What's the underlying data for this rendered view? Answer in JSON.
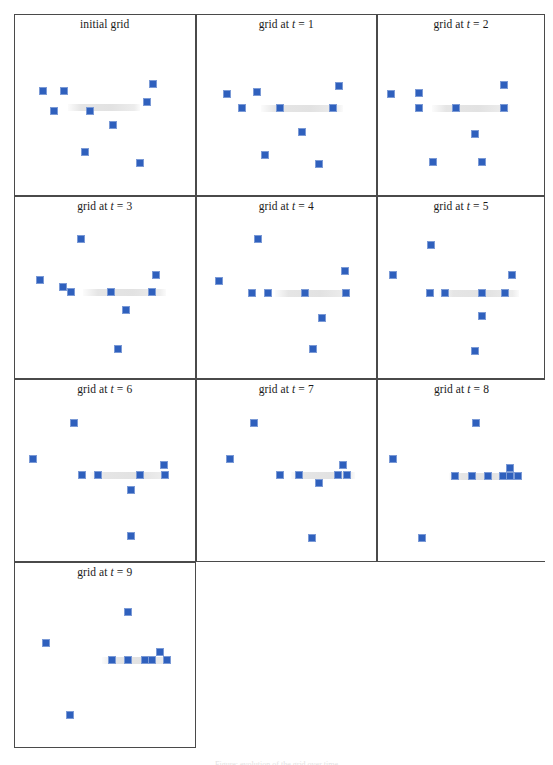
{
  "figure": {
    "width": 553,
    "height": 765,
    "background": "#ffffff",
    "marker_color": "#2f60bd",
    "marker_border_color": "#7b9ad6",
    "panel_border_color": "#4a4a4a",
    "band_color": "#aaaaaa",
    "caption": "Figure: evolution of the grid over time",
    "grid_cols": 3,
    "grid_rows": 4
  },
  "chart_data": {
    "type": "scatter",
    "xlabel": "",
    "ylabel": "",
    "xlim": [
      0,
      20
    ],
    "ylim": [
      0,
      20
    ],
    "grid": false,
    "legend": "none",
    "marker": "square",
    "marker_color": "#2f60bd",
    "annotation": "A faint horizontal grey band marks the target line toward which the blue cells converge.",
    "panels": [
      {
        "label_prefix": "initial grid",
        "label_var": "",
        "label_value": "",
        "title": "initial grid",
        "band": {
          "x1": 5.6,
          "x2": 14.0,
          "y": 10.6
        },
        "points": [
          {
            "x": 2.6,
            "y": 12.6
          },
          {
            "x": 5.1,
            "y": 12.7
          },
          {
            "x": 15.6,
            "y": 13.6
          },
          {
            "x": 14.9,
            "y": 11.3
          },
          {
            "x": 3.9,
            "y": 10.1
          },
          {
            "x": 8.2,
            "y": 10.1
          },
          {
            "x": 10.9,
            "y": 8.4
          },
          {
            "x": 7.6,
            "y": 4.9
          },
          {
            "x": 14.1,
            "y": 3.5
          }
        ]
      },
      {
        "label_prefix": "grid at",
        "label_var": "t",
        "label_value": "1",
        "title": "grid at t = 1",
        "band": {
          "x1": 6.9,
          "x2": 16.6,
          "y": 10.5
        },
        "points": [
          {
            "x": 2.9,
            "y": 12.3
          },
          {
            "x": 6.4,
            "y": 12.5
          },
          {
            "x": 16.1,
            "y": 13.3
          },
          {
            "x": 4.7,
            "y": 10.5
          },
          {
            "x": 9.1,
            "y": 10.5
          },
          {
            "x": 15.4,
            "y": 10.5
          },
          {
            "x": 11.7,
            "y": 7.5
          },
          {
            "x": 7.4,
            "y": 4.6
          },
          {
            "x": 13.8,
            "y": 3.4
          }
        ]
      },
      {
        "label_prefix": "grid at",
        "label_var": "t",
        "label_value": "2",
        "title": "grid at t = 2",
        "band": {
          "x1": 6.2,
          "x2": 16.2,
          "y": 10.5
        },
        "points": [
          {
            "x": 0.9,
            "y": 12.3
          },
          {
            "x": 4.5,
            "y": 12.4
          },
          {
            "x": 15.4,
            "y": 13.4
          },
          {
            "x": 4.5,
            "y": 10.5
          },
          {
            "x": 9.2,
            "y": 10.5
          },
          {
            "x": 15.4,
            "y": 10.5
          },
          {
            "x": 11.7,
            "y": 7.2
          },
          {
            "x": 6.3,
            "y": 3.7
          },
          {
            "x": 12.6,
            "y": 3.7
          }
        ]
      },
      {
        "label_prefix": "grid at",
        "label_var": "t",
        "label_value": "3",
        "title": "grid at t = 3",
        "band": {
          "x1": 7.3,
          "x2": 17.1,
          "y": 10.3
        },
        "points": [
          {
            "x": 7.1,
            "y": 17.0
          },
          {
            "x": 15.9,
            "y": 12.5
          },
          {
            "x": 2.3,
            "y": 11.8
          },
          {
            "x": 4.9,
            "y": 10.9
          },
          {
            "x": 5.9,
            "y": 10.3
          },
          {
            "x": 10.6,
            "y": 10.3
          },
          {
            "x": 15.4,
            "y": 10.3
          },
          {
            "x": 12.4,
            "y": 8.0
          },
          {
            "x": 11.5,
            "y": 3.2
          }
        ]
      },
      {
        "label_prefix": "grid at",
        "label_var": "t",
        "label_value": "4",
        "title": "grid at t = 4",
        "band": {
          "x1": 8.6,
          "x2": 17.4,
          "y": 10.2
        },
        "points": [
          {
            "x": 6.5,
            "y": 17.0
          },
          {
            "x": 16.8,
            "y": 13.0
          },
          {
            "x": 1.9,
            "y": 11.7
          },
          {
            "x": 5.8,
            "y": 10.2
          },
          {
            "x": 7.7,
            "y": 10.2
          },
          {
            "x": 12.1,
            "y": 10.2
          },
          {
            "x": 16.9,
            "y": 10.2
          },
          {
            "x": 14.1,
            "y": 7.1
          },
          {
            "x": 13.0,
            "y": 3.1
          }
        ]
      },
      {
        "label_prefix": "grid at",
        "label_var": "t",
        "label_value": "5",
        "title": "grid at t = 5",
        "band": {
          "x1": 7.0,
          "x2": 17.3,
          "y": 10.2
        },
        "points": [
          {
            "x": 6.0,
            "y": 16.2
          },
          {
            "x": 1.2,
            "y": 12.4
          },
          {
            "x": 16.4,
            "y": 12.5
          },
          {
            "x": 5.9,
            "y": 10.2
          },
          {
            "x": 7.8,
            "y": 10.2
          },
          {
            "x": 12.6,
            "y": 10.2
          },
          {
            "x": 15.5,
            "y": 10.2
          },
          {
            "x": 12.6,
            "y": 7.3
          },
          {
            "x": 11.7,
            "y": 2.9
          }
        ]
      },
      {
        "label_prefix": "grid at",
        "label_var": "t",
        "label_value": "6",
        "title": "grid at t = 6",
        "band": {
          "x1": 8.2,
          "x2": 17.3,
          "y": 10.3
        },
        "points": [
          {
            "x": 6.2,
            "y": 16.9
          },
          {
            "x": 1.4,
            "y": 12.3
          },
          {
            "x": 16.9,
            "y": 11.6
          },
          {
            "x": 7.2,
            "y": 10.3
          },
          {
            "x": 9.1,
            "y": 10.3
          },
          {
            "x": 14.0,
            "y": 10.3
          },
          {
            "x": 17.0,
            "y": 10.3
          },
          {
            "x": 13.0,
            "y": 8.4
          },
          {
            "x": 13.0,
            "y": 2.6
          }
        ]
      },
      {
        "label_prefix": "grid at",
        "label_var": "t",
        "label_value": "7",
        "title": "grid at t = 7",
        "band": {
          "x1": 10.5,
          "x2": 18.0,
          "y": 10.3
        },
        "points": [
          {
            "x": 6.1,
            "y": 16.9
          },
          {
            "x": 3.2,
            "y": 12.3
          },
          {
            "x": 16.6,
            "y": 11.6
          },
          {
            "x": 9.2,
            "y": 10.3
          },
          {
            "x": 11.4,
            "y": 10.3
          },
          {
            "x": 16.0,
            "y": 10.3
          },
          {
            "x": 17.0,
            "y": 10.3
          },
          {
            "x": 13.8,
            "y": 9.3
          },
          {
            "x": 12.9,
            "y": 2.4
          }
        ]
      },
      {
        "label_prefix": "grid at",
        "label_var": "t",
        "label_value": "8",
        "title": "grid at t = 8",
        "band": {
          "x1": 8.3,
          "x2": 17.5,
          "y": 10.2
        },
        "points": [
          {
            "x": 11.8,
            "y": 16.8
          },
          {
            "x": 1.2,
            "y": 12.3
          },
          {
            "x": 9.1,
            "y": 10.2
          },
          {
            "x": 11.3,
            "y": 10.2
          },
          {
            "x": 13.3,
            "y": 10.2
          },
          {
            "x": 15.2,
            "y": 10.2
          },
          {
            "x": 16.1,
            "y": 10.2
          },
          {
            "x": 16.1,
            "y": 11.2
          },
          {
            "x": 17.2,
            "y": 10.2
          },
          {
            "x": 4.9,
            "y": 2.4
          }
        ]
      },
      {
        "label_prefix": "grid at",
        "label_var": "t",
        "label_value": "9",
        "title": "grid at t = 9",
        "band": {
          "x1": 9.5,
          "x2": 17.7,
          "y": 10.2
        },
        "points": [
          {
            "x": 12.6,
            "y": 16.2
          },
          {
            "x": 3.0,
            "y": 12.4
          },
          {
            "x": 10.7,
            "y": 10.2
          },
          {
            "x": 12.6,
            "y": 10.2
          },
          {
            "x": 14.6,
            "y": 10.2
          },
          {
            "x": 15.5,
            "y": 10.2
          },
          {
            "x": 16.4,
            "y": 11.2
          },
          {
            "x": 17.2,
            "y": 10.2
          },
          {
            "x": 5.8,
            "y": 3.4
          }
        ]
      }
    ]
  }
}
